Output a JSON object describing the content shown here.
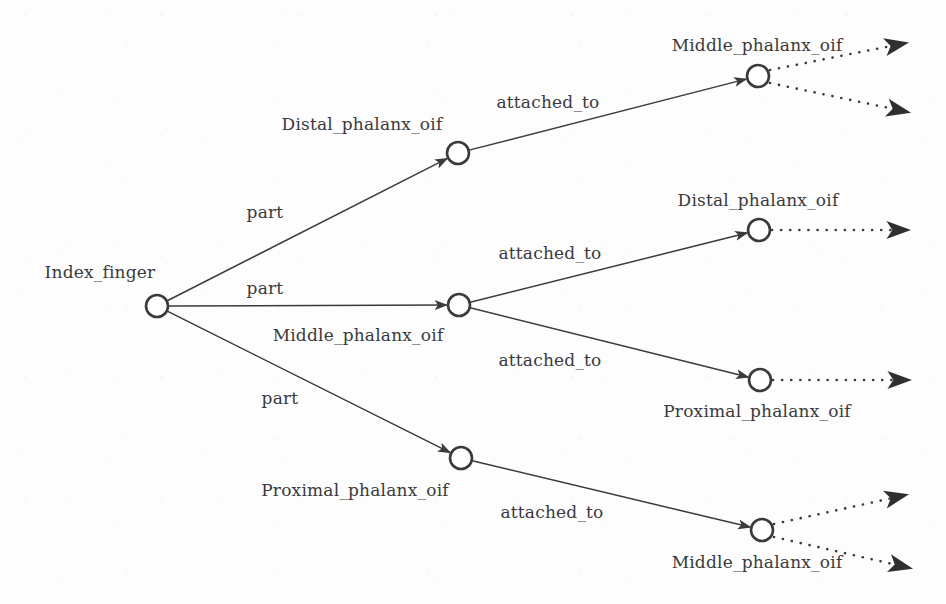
{
  "figure": {
    "type": "directed-graph",
    "background_color": "#fdfdfd",
    "stroke_color": "#3a3a3c",
    "node_fill": "#ffffff",
    "node_radius": 11,
    "width": 946,
    "height": 604
  },
  "nodes": [
    {
      "id": "root",
      "label": "Index_finger",
      "cx": 157,
      "cy": 306,
      "label_x": 100,
      "label_y": 272,
      "label_anchor": "middle"
    },
    {
      "id": "distal_l1",
      "label": "Distal_phalanx_oif",
      "cx": 458,
      "cy": 153,
      "label_x": 362,
      "label_y": 124,
      "label_anchor": "middle"
    },
    {
      "id": "middle_l1",
      "label": "Middle_phalanx_oif",
      "cx": 459,
      "cy": 305,
      "label_x": 358,
      "label_y": 335,
      "label_anchor": "middle"
    },
    {
      "id": "proximal_l1",
      "label": "Proximal_phalanx_oif",
      "cx": 461,
      "cy": 458,
      "label_x": 355,
      "label_y": 490,
      "label_anchor": "middle"
    },
    {
      "id": "middle_l2a",
      "label": "Middle_phalanx_oif",
      "cx": 758,
      "cy": 76,
      "label_x": 757,
      "label_y": 45,
      "label_anchor": "middle"
    },
    {
      "id": "distal_l2",
      "label": "Distal_phalanx_oif",
      "cx": 759,
      "cy": 230,
      "label_x": 758,
      "label_y": 200,
      "label_anchor": "middle"
    },
    {
      "id": "proximal_l2",
      "label": "Proximal_phalanx_oif",
      "cx": 760,
      "cy": 380,
      "label_x": 757,
      "label_y": 411,
      "label_anchor": "middle"
    },
    {
      "id": "middle_l2b",
      "label": "Middle_phalanx_oif",
      "cx": 762,
      "cy": 530,
      "label_x": 757,
      "label_y": 562,
      "label_anchor": "middle"
    }
  ],
  "edges": [
    {
      "from": "root",
      "to": "distal_l1",
      "label": "part",
      "label_x": 265,
      "label_y": 212,
      "style": "solid"
    },
    {
      "from": "root",
      "to": "middle_l1",
      "label": "part",
      "label_x": 265,
      "label_y": 288,
      "style": "solid"
    },
    {
      "from": "root",
      "to": "proximal_l1",
      "label": "part",
      "label_x": 280,
      "label_y": 398,
      "style": "solid"
    },
    {
      "from": "distal_l1",
      "to": "middle_l2a",
      "label": "attached_to",
      "label_x": 548,
      "label_y": 102,
      "style": "solid"
    },
    {
      "from": "middle_l1",
      "to": "distal_l2",
      "label": "attached_to",
      "label_x": 550,
      "label_y": 253,
      "style": "solid"
    },
    {
      "from": "middle_l1",
      "to": "proximal_l2",
      "label": "attached_to",
      "label_x": 550,
      "label_y": 360,
      "style": "solid"
    },
    {
      "from": "proximal_l1",
      "to": "middle_l2b",
      "label": "attached_to",
      "label_x": 552,
      "label_y": 512,
      "style": "solid"
    }
  ],
  "dotted_edges": [
    {
      "from": "middle_l2a",
      "x1": 770,
      "y1": 70,
      "x2": 906,
      "y2": 43,
      "label": ""
    },
    {
      "from": "middle_l2a",
      "x1": 770,
      "y1": 83,
      "x2": 908,
      "y2": 112,
      "label": ""
    },
    {
      "from": "distal_l2",
      "x1": 772,
      "y1": 230,
      "x2": 908,
      "y2": 230,
      "label": ""
    },
    {
      "from": "proximal_l2",
      "x1": 773,
      "y1": 380,
      "x2": 909,
      "y2": 380,
      "label": ""
    },
    {
      "from": "middle_l2b",
      "x1": 774,
      "y1": 524,
      "x2": 906,
      "y2": 495,
      "label": ""
    },
    {
      "from": "middle_l2b",
      "x1": 774,
      "y1": 537,
      "x2": 910,
      "y2": 568,
      "label": ""
    }
  ]
}
